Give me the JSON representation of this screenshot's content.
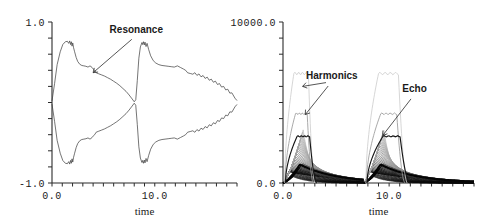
{
  "figure": {
    "title": "",
    "panel_count": 2
  },
  "chart_data": [
    {
      "id": "left-panel",
      "type": "line",
      "title": "",
      "xlabel": "time",
      "ylabel": "",
      "xlim": [
        0.0,
        18.0
      ],
      "ylim": [
        -1.0,
        1.0
      ],
      "grid": false,
      "legend_position": "none",
      "y_ticks_labeled": [
        {
          "value": 1.0,
          "label": "1.0"
        },
        {
          "value": -1.0,
          "label": "-1.0"
        }
      ],
      "y_minor_tick_count": 9,
      "x_ticks_labeled": [
        {
          "value": 0.0,
          "label": "0.0"
        },
        {
          "value": 10.0,
          "label": "10.0"
        }
      ],
      "x_minor_tick_count": 18,
      "annotations": [
        {
          "text": "Resonance",
          "label_x": 8.2,
          "label_y": 0.86,
          "arrow_to_x": 4.0,
          "arrow_to_y": 0.37
        }
      ],
      "series": [
        {
          "name": "envelope-upper",
          "description": "upper oscillation envelope, two bursts with serrated decay",
          "style": "thin-dark",
          "points_x": [
            0.0,
            0.25,
            0.5,
            0.8,
            1.05,
            1.3,
            1.5,
            1.62,
            1.72,
            1.8,
            1.88,
            1.95,
            2.02,
            2.1,
            2.2,
            2.35,
            2.5,
            2.7,
            2.9,
            3.1,
            3.3,
            3.5,
            3.7,
            3.9,
            4.05,
            4.15,
            4.3,
            4.5,
            4.8,
            5.1,
            5.4,
            5.7,
            6.0,
            6.3,
            6.6,
            6.9,
            7.2,
            7.5,
            7.8,
            8.0,
            8.15,
            8.3,
            8.45,
            8.6,
            8.75,
            8.82,
            8.9,
            8.98,
            9.05,
            9.15,
            9.25,
            9.4,
            9.6,
            9.85,
            10.1,
            10.4,
            10.7,
            11.0,
            11.3,
            11.6,
            11.9,
            12.2,
            12.5,
            12.8,
            13.0,
            13.2,
            13.5,
            13.9,
            14.3,
            14.7,
            15.1,
            15.5,
            15.9,
            16.3,
            16.7,
            17.1,
            17.5,
            17.8,
            18.0
          ],
          "points_y": [
            0.02,
            0.26,
            0.47,
            0.63,
            0.72,
            0.755,
            0.76,
            0.735,
            0.765,
            0.72,
            0.755,
            0.7,
            0.74,
            0.68,
            0.63,
            0.56,
            0.51,
            0.475,
            0.46,
            0.455,
            0.45,
            0.44,
            0.455,
            0.435,
            0.41,
            0.4,
            0.395,
            0.385,
            0.37,
            0.355,
            0.335,
            0.315,
            0.29,
            0.265,
            0.235,
            0.2,
            0.165,
            0.12,
            0.07,
            0.035,
            0.06,
            0.3,
            0.55,
            0.69,
            0.745,
            0.72,
            0.755,
            0.715,
            0.75,
            0.695,
            0.735,
            0.66,
            0.58,
            0.52,
            0.49,
            0.47,
            0.46,
            0.455,
            0.45,
            0.445,
            0.44,
            0.455,
            0.435,
            0.415,
            0.4,
            0.395,
            0.385,
            0.37,
            0.355,
            0.335,
            0.315,
            0.29,
            0.265,
            0.235,
            0.2,
            0.165,
            0.12,
            0.08,
            0.05
          ]
        },
        {
          "name": "envelope-lower",
          "description": "lower oscillation envelope, mirror of upper",
          "style": "thin-dark",
          "points_x": [
            0.0,
            0.25,
            0.5,
            0.8,
            1.05,
            1.3,
            1.5,
            1.62,
            1.72,
            1.8,
            1.88,
            1.95,
            2.02,
            2.1,
            2.2,
            2.35,
            2.5,
            2.7,
            2.9,
            3.1,
            3.3,
            3.5,
            3.7,
            3.9,
            4.05,
            4.15,
            4.3,
            4.5,
            4.8,
            5.1,
            5.4,
            5.7,
            6.0,
            6.3,
            6.6,
            6.9,
            7.2,
            7.5,
            7.8,
            8.0,
            8.15,
            8.3,
            8.45,
            8.6,
            8.75,
            8.82,
            8.9,
            8.98,
            9.05,
            9.15,
            9.25,
            9.4,
            9.6,
            9.85,
            10.1,
            10.4,
            10.7,
            11.0,
            11.3,
            11.6,
            11.9,
            12.2,
            12.5,
            12.8,
            13.0,
            13.2,
            13.5,
            13.9,
            14.3,
            14.7,
            15.1,
            15.5,
            15.9,
            16.3,
            16.7,
            17.1,
            17.5,
            17.8,
            18.0
          ],
          "points_y": [
            -0.02,
            -0.26,
            -0.47,
            -0.63,
            -0.72,
            -0.755,
            -0.76,
            -0.735,
            -0.765,
            -0.72,
            -0.755,
            -0.7,
            -0.74,
            -0.68,
            -0.63,
            -0.56,
            -0.51,
            -0.475,
            -0.46,
            -0.455,
            -0.45,
            -0.44,
            -0.455,
            -0.435,
            -0.41,
            -0.4,
            -0.395,
            -0.385,
            -0.37,
            -0.355,
            -0.335,
            -0.315,
            -0.29,
            -0.265,
            -0.235,
            -0.2,
            -0.165,
            -0.12,
            -0.07,
            -0.035,
            -0.06,
            -0.3,
            -0.55,
            -0.69,
            -0.745,
            -0.72,
            -0.755,
            -0.715,
            -0.75,
            -0.695,
            -0.735,
            -0.66,
            -0.58,
            -0.52,
            -0.49,
            -0.47,
            -0.46,
            -0.455,
            -0.45,
            -0.445,
            -0.44,
            -0.455,
            -0.435,
            -0.415,
            -0.4,
            -0.395,
            -0.385,
            -0.37,
            -0.355,
            -0.335,
            -0.315,
            -0.29,
            -0.265,
            -0.235,
            -0.2,
            -0.165,
            -0.12,
            -0.08,
            -0.05
          ]
        }
      ]
    },
    {
      "id": "right-panel",
      "type": "line",
      "title": "",
      "xlabel": "time",
      "ylabel": "",
      "xlim": [
        0.0,
        18.0
      ],
      "ylim": [
        0.0,
        10000.0
      ],
      "grid": false,
      "legend_position": "none",
      "y_ticks_labeled": [
        {
          "value": 10000.0,
          "label": "10000.0"
        },
        {
          "value": 0.0,
          "label": "0.0"
        }
      ],
      "y_minor_tick_count": 9,
      "x_ticks_labeled": [
        {
          "value": 0.0,
          "label": "0.0"
        },
        {
          "value": 10.0,
          "label": "10.0"
        }
      ],
      "x_minor_tick_count": 18,
      "annotations": [
        {
          "text": "Harmonics",
          "label_x": 4.6,
          "label_y": 6450,
          "arrow_to_x": 1.85,
          "arrow_to_y": 6000
        },
        {
          "text": "Harmonics",
          "label_x": 4.6,
          "label_y": 6450,
          "arrow_to_x": 2.1,
          "arrow_to_y": 4250
        },
        {
          "text": "Echo",
          "label_x": 12.4,
          "label_y": 5650,
          "arrow_to_x": 9.4,
          "arrow_to_y": 2950
        }
      ],
      "series": [
        {
          "name": "harmonic-plateau-high",
          "description": "faint tall plateau harmonic, rises then drops sharply",
          "style": "light",
          "burst_peak": 6900,
          "plateau_level": 6800
        },
        {
          "name": "harmonic-plateau-mid",
          "description": "faint mid plateau harmonic",
          "style": "mid",
          "burst_peak": 4400,
          "plateau_level": 4300
        },
        {
          "name": "harmonic-plateau-low",
          "description": "dark low plateau harmonic",
          "style": "dark",
          "burst_peak": 3050,
          "plateau_level": 2900
        },
        {
          "name": "decay-family",
          "description": "dense family of exponentially decaying modes spanning the burst",
          "style": "dark-family",
          "member_count": 28,
          "peak_range": [
            700,
            3300
          ]
        },
        {
          "name": "ground-mode",
          "description": "thick lowest decaying mode near the axis",
          "style": "thick-dark",
          "burst_peak": 1150
        }
      ],
      "bursts": [
        {
          "start": 0.0,
          "end": 7.6
        },
        {
          "start": 7.6,
          "end": 18.0
        }
      ]
    }
  ]
}
